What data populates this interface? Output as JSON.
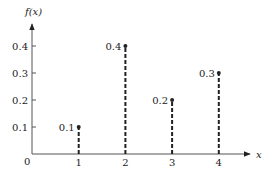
{
  "chart_data": {
    "type": "stem",
    "title": "",
    "xlabel": "x",
    "ylabel": "f(x)",
    "origin_label": "0",
    "x": [
      1,
      2,
      3,
      4
    ],
    "values": [
      0.1,
      0.4,
      0.2,
      0.3
    ],
    "value_labels": [
      "0.1",
      "0.4",
      "0.2",
      "0.3"
    ],
    "x_tick_labels": [
      "1",
      "2",
      "3",
      "4"
    ],
    "y_tick_labels": [
      "0.1",
      "0.2",
      "0.3",
      "0.4"
    ],
    "y_ticks": [
      0.1,
      0.2,
      0.3,
      0.4
    ],
    "ylim": [
      0,
      0.45
    ],
    "xlim": [
      0,
      4.6
    ],
    "grid": false,
    "legend": null,
    "stem_style": "dashed",
    "colors": {
      "line": "#222222",
      "axis": "#555555"
    }
  }
}
